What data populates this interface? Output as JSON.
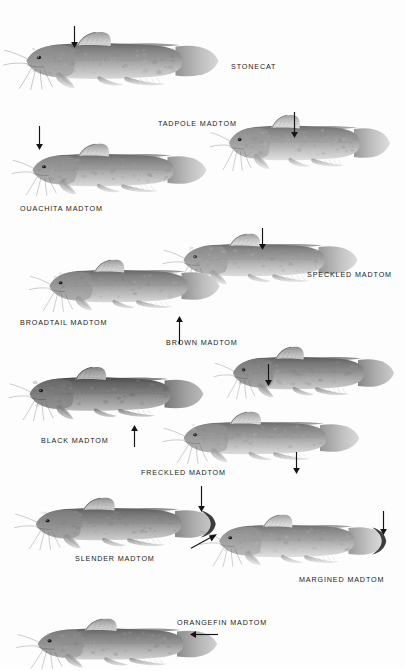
{
  "plate": {
    "title": "Madtoms and Stonecat plate",
    "background_color": "#fdfdfd",
    "ink_color": "#1b1b1b",
    "style": "grayscale scientific illustration plate",
    "species_count": 10
  },
  "species": [
    {
      "label": "STONECAT",
      "label_x": 231,
      "label_y": 62,
      "fish_x": 18,
      "fish_y": 30,
      "fish_w": 210,
      "fish_h": 62,
      "body_fill": "#9b9b9b",
      "tail_dark": false,
      "arrow": {
        "x": 74,
        "y": 26,
        "dir": "down",
        "len": 22,
        "name": "arrow-dorsal-fin"
      }
    },
    {
      "label": "TADPOLE MADTOM",
      "label_x": 158,
      "label_y": 119,
      "fish_x": 222,
      "fish_y": 113,
      "fish_w": 176,
      "fish_h": 60,
      "body_fill": "#a2a2a2",
      "tail_dark": false,
      "arrow": {
        "x": 294,
        "y": 112,
        "dir": "down",
        "len": 26,
        "name": "arrow-lateral-line"
      }
    },
    {
      "label": "OUACHITA MADTOM",
      "label_x": 20,
      "label_y": 204,
      "fish_x": 25,
      "fish_y": 142,
      "fish_w": 190,
      "fish_h": 56,
      "body_fill": "#9d9d9d",
      "tail_dark": false,
      "arrow": {
        "x": 39,
        "y": 126,
        "dir": "down",
        "len": 24,
        "name": "arrow-nape"
      }
    },
    {
      "label": "SPECKLED MADTOM",
      "label_x": 307,
      "label_y": 270,
      "fish_x": 176,
      "fish_y": 232,
      "fish_w": 190,
      "fish_h": 56,
      "body_fill": "#a0a0a0",
      "tail_dark": false,
      "arrow": {
        "x": 262,
        "y": 228,
        "dir": "down",
        "len": 22,
        "name": "arrow-dorsum"
      }
    },
    {
      "label": "BROADTAIL MADTOM",
      "label_x": 20,
      "label_y": 318,
      "fish_x": 42,
      "fish_y": 258,
      "fish_w": 186,
      "fish_h": 56,
      "body_fill": "#9a9a9a",
      "tail_dark": false,
      "arrow": {
        "x": 179,
        "y": 316,
        "dir": "up",
        "len": 28,
        "name": "arrow-caudal-fin"
      }
    },
    {
      "label": "BROWN MADTOM",
      "label_x": 166,
      "label_y": 338,
      "fish_x": 226,
      "fish_y": 345,
      "fish_w": 176,
      "fish_h": 56,
      "body_fill": "#8f8f8f",
      "tail_dark": false,
      "arrow": {
        "x": 268,
        "y": 364,
        "dir": "down",
        "len": 22,
        "name": "arrow-anal-fin"
      }
    },
    {
      "label": "BLACK MADTOM",
      "label_x": 41,
      "label_y": 436,
      "fish_x": 22,
      "fish_y": 365,
      "fish_w": 190,
      "fish_h": 58,
      "body_fill": "#7e7e7e",
      "tail_dark": false,
      "arrow": {
        "x": 134,
        "y": 425,
        "dir": "up",
        "len": 22,
        "name": "arrow-pelvic-fin"
      }
    },
    {
      "label": "FRECKLED MADTOM",
      "label_x": 141,
      "label_y": 468,
      "fish_x": 176,
      "fish_y": 410,
      "fish_w": 192,
      "fish_h": 56,
      "body_fill": "#9e9e9e",
      "tail_dark": false,
      "arrow": {
        "x": 296,
        "y": 452,
        "dir": "down",
        "len": 22,
        "name": "arrow-anal-base"
      }
    },
    {
      "label": "SLENDER MADTOM",
      "label_x": 75,
      "label_y": 554,
      "fish_x": 28,
      "fish_y": 496,
      "fish_w": 196,
      "fish_h": 56,
      "body_fill": "#909090",
      "tail_dark": true,
      "arrow": {
        "x": 201,
        "y": 486,
        "dir": "down",
        "len": 26,
        "name": "arrow-caudal-margin"
      }
    },
    {
      "label": "MARGINED MADTOM",
      "label_x": 299,
      "label_y": 575,
      "fish_x": 212,
      "fish_y": 513,
      "fish_w": 182,
      "fish_h": 56,
      "body_fill": "#a3a3a3",
      "tail_dark": true,
      "arrow": {
        "x": 383,
        "y": 511,
        "dir": "down",
        "len": 24,
        "name": "arrow-caudal-margin"
      },
      "arrow2": {
        "x": 217,
        "y": 548,
        "dir": "diag-up-right",
        "len": 26,
        "name": "arrow-barbel"
      }
    },
    {
      "label": "ORANGEFIN MADTOM",
      "label_x": 177,
      "label_y": 618,
      "fish_x": 30,
      "fish_y": 617,
      "fish_w": 196,
      "fish_h": 54,
      "body_fill": "#949494",
      "tail_dark": false,
      "arrow": {
        "x": 218,
        "y": 634,
        "dir": "left",
        "len": 28,
        "name": "arrow-caudal-fin"
      }
    }
  ]
}
